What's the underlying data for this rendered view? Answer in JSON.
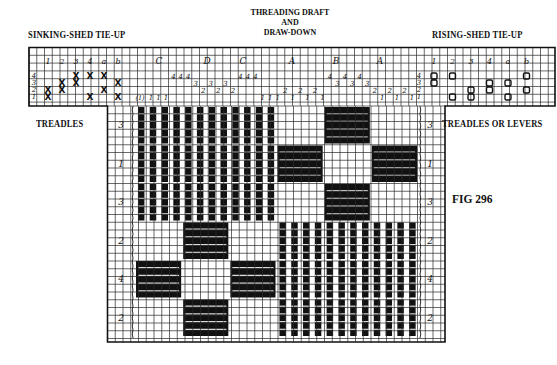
{
  "title": {
    "line1": "THREADING DRAFT",
    "line2": "AND",
    "line3": "DRAW-DOWN"
  },
  "labels": {
    "sinking_tieup": "SINKING-SHED TIE-UP",
    "rising_tieup": "RISING-SHED TIE-UP",
    "treadles_left": "TREADLES",
    "treadles_right": "TREADLES OR LEVERS",
    "figure": "FIG 296"
  },
  "tieup_columns": [
    "1",
    "2",
    "3",
    "4",
    "a",
    "b"
  ],
  "shaft_numbers": [
    "4",
    "3",
    "2",
    "1"
  ],
  "sinking_tieup": {
    "mark": "X",
    "cells": [
      {
        "col": "1",
        "shafts": [
          "2",
          "1"
        ]
      },
      {
        "col": "2",
        "shafts": [
          "3",
          "2"
        ]
      },
      {
        "col": "3",
        "shafts": [
          "4",
          "3"
        ]
      },
      {
        "col": "4",
        "shafts": [
          "4",
          "1"
        ]
      },
      {
        "col": "a",
        "shafts": [
          "4",
          "2"
        ]
      },
      {
        "col": "b",
        "shafts": [
          "3",
          "1"
        ]
      }
    ]
  },
  "rising_tieup": {
    "mark": "O",
    "cells": [
      {
        "col": "1",
        "shafts": [
          "4",
          "3"
        ]
      },
      {
        "col": "2",
        "shafts": [
          "4",
          "1"
        ]
      },
      {
        "col": "3",
        "shafts": [
          "2",
          "1"
        ]
      },
      {
        "col": "4",
        "shafts": [
          "3",
          "2"
        ]
      },
      {
        "col": "a",
        "shafts": [
          "3",
          "1"
        ]
      },
      {
        "col": "b",
        "shafts": [
          "4",
          "2"
        ]
      }
    ]
  },
  "threading": {
    "block_letters": [
      "C",
      "D",
      "C",
      "A",
      "B",
      "A"
    ],
    "start_marker": "(1)",
    "sequence": [
      "1",
      "1",
      "1",
      "4",
      "4",
      "4",
      "3",
      "2",
      "3",
      "2",
      "3",
      "2",
      "4",
      "4",
      "4",
      "1",
      "1",
      "1",
      "2",
      "1",
      "2",
      "1",
      "2",
      "1",
      "4",
      "3",
      "4",
      "3",
      "4",
      "3",
      "2",
      "1",
      "2",
      "1",
      "2",
      "1"
    ]
  },
  "treadling": {
    "blocks": [
      "3",
      "1",
      "3",
      "2",
      "4",
      "2"
    ]
  },
  "drawdown": {
    "column_blocks": [
      "C",
      "D",
      "C",
      "A",
      "B",
      "A"
    ],
    "row_blocks": [
      "3",
      "1",
      "3",
      "2",
      "4",
      "2"
    ],
    "pattern": [
      [
        "stripe",
        "stripe",
        "stripe",
        "empty",
        "solid",
        "empty"
      ],
      [
        "stripe",
        "stripe",
        "stripe",
        "solid",
        "empty",
        "solid"
      ],
      [
        "stripe",
        "stripe",
        "stripe",
        "empty",
        "solid",
        "empty"
      ],
      [
        "empty",
        "solid",
        "empty",
        "stripe",
        "stripe",
        "stripe"
      ],
      [
        "solid",
        "empty",
        "solid",
        "stripe",
        "stripe",
        "stripe"
      ],
      [
        "empty",
        "solid",
        "empty",
        "stripe",
        "stripe",
        "stripe"
      ]
    ]
  },
  "colors": {
    "ink": "#111111",
    "grid": "#2a2a2a",
    "paper": "#ffffff"
  }
}
